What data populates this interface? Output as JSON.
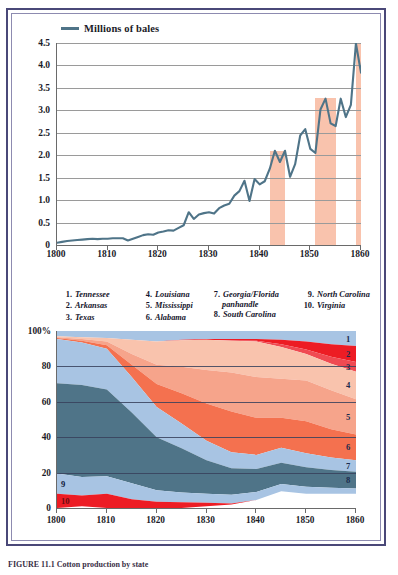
{
  "figure": {
    "caption": "FIGURE 11.1  Cotton production by state",
    "border_color": "#4a4878"
  },
  "line_chart": {
    "legend_label": "Millions of bales",
    "legend_color": "#4f7488",
    "line_color": "#4f7488",
    "highlight_color": "#f9c3ad",
    "ylabels": [
      "4.5",
      "4.0",
      "3.5",
      "3.0",
      "2.5",
      "2.0",
      "1.5",
      "1.0",
      "0.5",
      "0"
    ],
    "xlabels": [
      "1800",
      "1810",
      "1820",
      "1830",
      "1840",
      "1850",
      "1860"
    ]
  },
  "state_key": {
    "columns": [
      {
        "entries": [
          {
            "num": "1.",
            "name": "Tennessee"
          },
          {
            "num": "2.",
            "name": "Arkansas"
          },
          {
            "num": "3.",
            "name": "Texas"
          }
        ]
      },
      {
        "entries": [
          {
            "num": "4.",
            "name": "Louisiana"
          },
          {
            "num": "5.",
            "name": "Mississippi"
          },
          {
            "num": "6.",
            "name": "Alabama"
          }
        ]
      },
      {
        "entries": [
          {
            "num": "7.",
            "name": "Georgia/Florida",
            "cont": "panhandle"
          },
          {
            "num": "8.",
            "name": "South Carolina"
          }
        ]
      },
      {
        "entries": [
          {
            "num": "9.",
            "name": "North Carolina"
          },
          {
            "num": "10.",
            "name": "Virginia"
          }
        ]
      }
    ]
  },
  "area_chart": {
    "ylabels": [
      "100%",
      "80",
      "60",
      "40",
      "20",
      "0"
    ],
    "xlabels": [
      "1800",
      "1810",
      "1820",
      "1830",
      "1840",
      "1850",
      "1860"
    ],
    "right_numbers": [
      "1",
      "2",
      "3",
      "4",
      "5",
      "6",
      "7",
      "8"
    ],
    "left_numbers": [
      "9",
      "10"
    ]
  },
  "chart_data": [
    {
      "type": "line",
      "title": "Cotton production",
      "xlabel": "",
      "ylabel": "Millions of bales",
      "legend": [
        "Millions of bales"
      ],
      "legend_position": "top-left",
      "grid": true,
      "xlim": [
        1800,
        1860
      ],
      "ylim": [
        0,
        4.5
      ],
      "yticks": [
        0,
        0.5,
        1.0,
        1.5,
        2.0,
        2.5,
        3.0,
        3.5,
        4.0,
        4.5
      ],
      "xticks": [
        1800,
        1810,
        1820,
        1830,
        1840,
        1850,
        1860
      ],
      "highlight_bands": [
        {
          "start": 1842,
          "end": 1845,
          "top": 2.1
        },
        {
          "start": 1851,
          "end": 1855,
          "top": 3.28
        },
        {
          "start": 1859,
          "end": 1860,
          "top": 4.5
        }
      ],
      "x": [
        1800,
        1801,
        1802,
        1803,
        1804,
        1805,
        1806,
        1807,
        1808,
        1809,
        1810,
        1811,
        1812,
        1813,
        1814,
        1815,
        1816,
        1817,
        1818,
        1819,
        1820,
        1821,
        1822,
        1823,
        1824,
        1825,
        1826,
        1827,
        1828,
        1829,
        1830,
        1831,
        1832,
        1833,
        1834,
        1835,
        1836,
        1837,
        1838,
        1839,
        1840,
        1841,
        1842,
        1843,
        1844,
        1845,
        1846,
        1847,
        1848,
        1849,
        1850,
        1851,
        1852,
        1853,
        1854,
        1855,
        1856,
        1857,
        1858,
        1859,
        1860
      ],
      "values": [
        0.05,
        0.07,
        0.09,
        0.1,
        0.11,
        0.12,
        0.13,
        0.14,
        0.13,
        0.14,
        0.14,
        0.15,
        0.15,
        0.15,
        0.1,
        0.14,
        0.18,
        0.22,
        0.24,
        0.23,
        0.28,
        0.3,
        0.33,
        0.32,
        0.38,
        0.44,
        0.73,
        0.58,
        0.68,
        0.71,
        0.73,
        0.7,
        0.82,
        0.88,
        0.92,
        1.1,
        1.2,
        1.43,
        0.98,
        1.47,
        1.35,
        1.42,
        1.7,
        2.1,
        1.85,
        2.1,
        1.52,
        1.8,
        2.44,
        2.58,
        2.14,
        2.05,
        3.02,
        3.26,
        2.71,
        2.65,
        3.26,
        2.85,
        3.12,
        4.49,
        3.84
      ]
    },
    {
      "type": "area",
      "stacked": true,
      "normalized": true,
      "title": "Share of cotton production by state",
      "xlabel": "",
      "ylabel": "Percent",
      "ylim": [
        0,
        100
      ],
      "yticks": [
        0,
        20,
        40,
        60,
        80,
        100
      ],
      "xticks": [
        1800,
        1810,
        1820,
        1830,
        1840,
        1850,
        1860
      ],
      "grid": true,
      "x": [
        1800,
        1805,
        1810,
        1815,
        1820,
        1825,
        1830,
        1835,
        1840,
        1845,
        1850,
        1855,
        1860
      ],
      "series": [
        {
          "name": "Tennessee",
          "key": "1",
          "color": "#a8c4e3",
          "values": [
            3.0,
            3.5,
            4.0,
            5.0,
            6.0,
            5.0,
            4.5,
            4.5,
            4.5,
            5.0,
            6.0,
            7.5,
            8.5
          ]
        },
        {
          "name": "Arkansas",
          "key": "2",
          "color": "#ed1c24",
          "values": [
            0.0,
            0.0,
            0.0,
            0.0,
            0.0,
            0.2,
            0.5,
            0.8,
            1.0,
            2.5,
            4.5,
            7.0,
            9.0
          ]
        },
        {
          "name": "Texas",
          "key": "3",
          "color": "#f04a52",
          "values": [
            0.0,
            0.0,
            0.0,
            0.0,
            0.0,
            0.0,
            0.0,
            0.2,
            0.5,
            1.5,
            2.5,
            4.0,
            5.5
          ]
        },
        {
          "name": "Louisiana",
          "key": "4",
          "color": "#f9c3ad",
          "values": [
            0.5,
            1.0,
            2.0,
            8.0,
            13.0,
            15.0,
            17.0,
            18.0,
            20.0,
            18.0,
            15.0,
            15.0,
            15.5
          ]
        },
        {
          "name": "Mississippi",
          "key": "5",
          "color": "#f6a48b",
          "values": [
            0.5,
            1.0,
            2.0,
            6.0,
            11.0,
            15.0,
            19.0,
            22.0,
            23.0,
            22.0,
            23.0,
            22.0,
            20.0
          ]
        },
        {
          "name": "Alabama",
          "key": "6",
          "color": "#f4714f",
          "values": [
            0.5,
            1.0,
            2.0,
            7.0,
            13.0,
            17.0,
            21.0,
            23.0,
            21.0,
            17.0,
            18.0,
            16.0,
            14.5
          ]
        },
        {
          "name": "North Carolina",
          "key": "7",
          "color": "#a8c4e3",
          "values": [
            25.0,
            24.0,
            23.0,
            20.0,
            17.0,
            14.0,
            11.0,
            9.0,
            8.0,
            8.5,
            8.0,
            7.0,
            6.5
          ]
        },
        {
          "name": "South Carolina",
          "key": "8",
          "color": "#4f7488",
          "values": [
            51.0,
            52.0,
            49.0,
            40.0,
            30.0,
            25.0,
            19.0,
            15.0,
            13.0,
            12.0,
            11.0,
            10.0,
            9.5
          ]
        },
        {
          "name": "Virginia (9 label)",
          "key": "9",
          "color": "#a8c4e3",
          "values": [
            11.5,
            10.5,
            10.0,
            9.0,
            6.5,
            5.5,
            5.0,
            5.0,
            4.5,
            4.0,
            4.0,
            3.5,
            3.0
          ]
        },
        {
          "name": "Virginia",
          "key": "10",
          "color": "#ed1c24",
          "values": [
            8.0,
            6.0,
            8.0,
            5.0,
            3.5,
            3.3,
            2.0,
            0.5,
            0.0,
            0.0,
            0.0,
            0.0,
            0.0
          ]
        }
      ]
    }
  ]
}
